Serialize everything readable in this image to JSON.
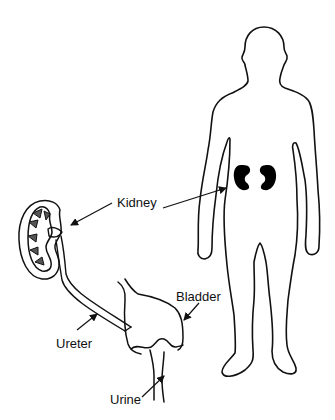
{
  "diagram": {
    "labels": {
      "kidney": "Kidney",
      "bladder": "Bladder",
      "ureter": "Ureter",
      "urine": "Urine"
    },
    "colors": {
      "line": "#111111",
      "fill": "#000000",
      "background": "#ffffff"
    },
    "parts": [
      {
        "id": "human-body-outline",
        "description": "standing human figure outline"
      },
      {
        "id": "kidneys-in-body",
        "description": "two solid black kidneys in lower back"
      },
      {
        "id": "kidney-cross-section",
        "description": "enlarged kidney cut-away"
      },
      {
        "id": "ureter-tube",
        "description": "tube from kidney to bladder"
      },
      {
        "id": "bladder",
        "description": "bladder with urethra"
      }
    ]
  }
}
